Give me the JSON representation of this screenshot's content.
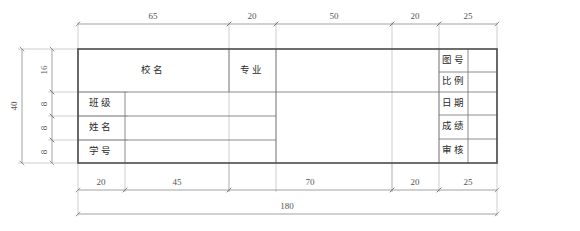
{
  "drawing": {
    "title": "title-block-template",
    "units": "mm",
    "total_width": 180,
    "total_height": 40,
    "line_color": "#555555",
    "border_color": "#4a4a4a",
    "dim_color": "#777777",
    "text_color": "#2b2b2b"
  },
  "cells": {
    "school": "校名",
    "major": "专业",
    "class": "班级",
    "name": "姓名",
    "student_id": "学号",
    "drawing_no": "图号",
    "scale": "比例",
    "date": "日期",
    "grade": "成绩",
    "review": "审核"
  },
  "dimensions": {
    "top": [
      {
        "label": "65",
        "value": 65
      },
      {
        "label": "20",
        "value": 20
      },
      {
        "label": "50",
        "value": 50
      },
      {
        "label": "20",
        "value": 20
      },
      {
        "label": "25",
        "value": 25
      }
    ],
    "bottom": [
      {
        "label": "20",
        "value": 20
      },
      {
        "label": "45",
        "value": 45
      },
      {
        "label": "70",
        "value": 70
      },
      {
        "label": "20",
        "value": 20
      },
      {
        "label": "25",
        "value": 25
      }
    ],
    "overall_bottom": {
      "label": "180",
      "value": 180
    },
    "left_inner": [
      {
        "label": "16",
        "value": 16
      },
      {
        "label": "8",
        "value": 8
      },
      {
        "label": "8",
        "value": 8
      },
      {
        "label": "8",
        "value": 8
      }
    ],
    "overall_left": {
      "label": "40",
      "value": 40
    }
  }
}
